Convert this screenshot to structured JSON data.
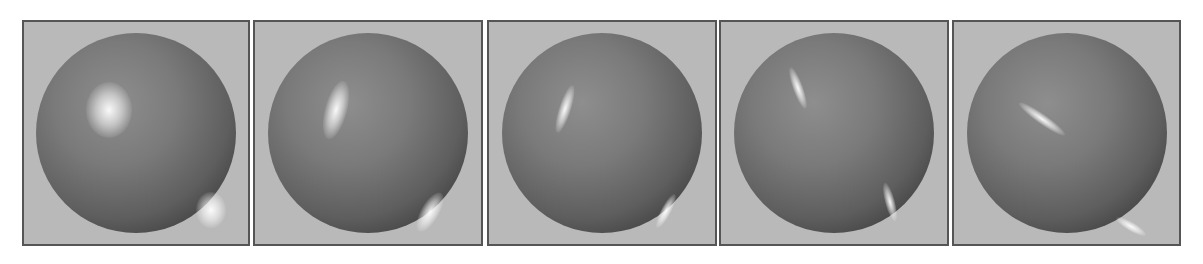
{
  "figure": {
    "background_color": "#b9b9b9",
    "border_color": "#555555",
    "panels": [
      {
        "index": 1,
        "highlight": "soft broad"
      },
      {
        "index": 2,
        "highlight": "narrower streak"
      },
      {
        "index": 3,
        "highlight": "thin streak"
      },
      {
        "index": 4,
        "highlight": "thin curved streak"
      },
      {
        "index": 5,
        "highlight": "thin diagonal arc"
      }
    ]
  }
}
